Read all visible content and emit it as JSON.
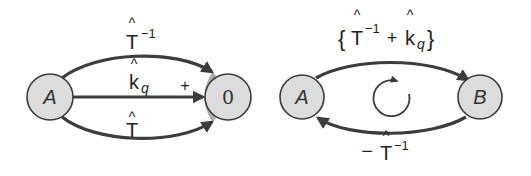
{
  "left_diagram": {
    "nodes": [
      {
        "id": "A",
        "label": "A"
      },
      {
        "id": "0",
        "label": "0"
      }
    ],
    "edges": [
      {
        "from": "A",
        "to": "0",
        "label_base": "T",
        "label_hat": "^",
        "label_sup": "−1",
        "path": "top-arc"
      },
      {
        "from": "A",
        "to": "0",
        "label_base": "k",
        "label_hat": "^",
        "label_sub": "q",
        "path": "straight",
        "sign": "+"
      },
      {
        "from": "A",
        "to": "0",
        "label_base": "T",
        "label_hat": "^",
        "path": "bottom-arc"
      }
    ]
  },
  "right_diagram": {
    "nodes": [
      {
        "id": "A",
        "label": "A"
      },
      {
        "id": "B",
        "label": "B"
      }
    ],
    "edges": [
      {
        "from": "A",
        "to": "B",
        "label_open": "{",
        "label_t": "T",
        "label_hat": "^",
        "label_sup": "−1",
        "label_plus": "+",
        "label_k": "k",
        "label_sub": "q",
        "label_close": "}"
      },
      {
        "from": "B",
        "to": "A",
        "label_minus": "−",
        "label_t": "T",
        "label_hat": "^",
        "label_sup": "−1"
      }
    ],
    "cycle_icon": "clockwise-circular-arrow"
  },
  "colors": {
    "node_fill": "#dcdcdc",
    "stroke": "#3c3c3c",
    "text": "#222222"
  }
}
